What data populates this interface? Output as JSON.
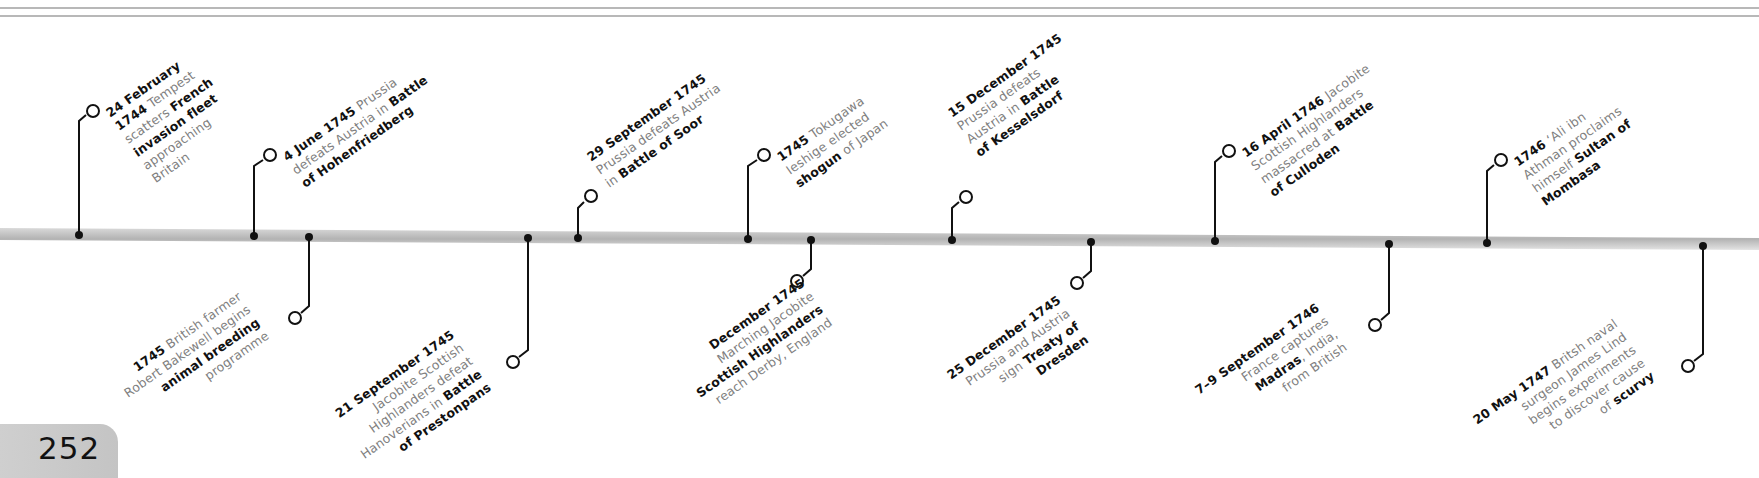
{
  "page": {
    "number": "252"
  },
  "timeline": {
    "bar_color": "#bdbdbd",
    "line_color": "#111111",
    "top_events": [
      {
        "lines": [
          [
            {
              "t": "24 February",
              "b": true
            }
          ],
          [
            {
              "t": "1744",
              "b": true
            },
            {
              "t": " Tempest",
              "b": false
            }
          ],
          [
            {
              "t": "scatters ",
              "b": false
            },
            {
              "t": "French",
              "b": true
            }
          ],
          [
            {
              "t": "invasion fleet",
              "b": true
            }
          ],
          [
            {
              "t": "approaching",
              "b": false
            }
          ],
          [
            {
              "t": "Britain",
              "b": false
            }
          ]
        ]
      },
      {
        "lines": [
          [
            {
              "t": "4 June 1745",
              "b": true
            },
            {
              "t": " Prussia",
              "b": false
            }
          ],
          [
            {
              "t": "defeats Austria in ",
              "b": false
            },
            {
              "t": "Battle",
              "b": true
            }
          ],
          [
            {
              "t": "of Hohenfriedberg",
              "b": true
            }
          ]
        ]
      },
      {
        "lines": [
          [
            {
              "t": "29 September 1745",
              "b": true
            }
          ],
          [
            {
              "t": "Prussia defeats Austria",
              "b": false
            }
          ],
          [
            {
              "t": "in ",
              "b": false
            },
            {
              "t": "Battle of Soor",
              "b": true
            }
          ]
        ]
      },
      {
        "lines": [
          [
            {
              "t": "1745",
              "b": true
            },
            {
              "t": " Tokugawa",
              "b": false
            }
          ],
          [
            {
              "t": "Ieshige elected",
              "b": false
            }
          ],
          [
            {
              "t": "shogun",
              "b": true
            },
            {
              "t": " of Japan",
              "b": false
            }
          ]
        ]
      },
      {
        "lines": [
          [
            {
              "t": "15 December 1745",
              "b": true
            }
          ],
          [
            {
              "t": "Prussia defeats",
              "b": false
            }
          ],
          [
            {
              "t": "Austria in ",
              "b": false
            },
            {
              "t": "Battle",
              "b": true
            }
          ],
          [
            {
              "t": "of Kesselsdorf",
              "b": true
            }
          ]
        ]
      },
      {
        "lines": [
          [
            {
              "t": "16 April 1746",
              "b": true
            },
            {
              "t": " Jacobite",
              "b": false
            }
          ],
          [
            {
              "t": "Scottish Highlanders",
              "b": false
            }
          ],
          [
            {
              "t": "massacred at ",
              "b": false
            },
            {
              "t": "Battle",
              "b": true
            }
          ],
          [
            {
              "t": "of Culloden",
              "b": true
            }
          ]
        ]
      },
      {
        "lines": [
          [
            {
              "t": "1746",
              "b": true
            },
            {
              "t": " ‘Ali ibn",
              "b": false
            }
          ],
          [
            {
              "t": "Athman proclaims",
              "b": false
            }
          ],
          [
            {
              "t": "himself ",
              "b": false
            },
            {
              "t": "Sultan of",
              "b": true
            }
          ],
          [
            {
              "t": "Mombasa",
              "b": true
            }
          ]
        ]
      }
    ],
    "bottom_events": [
      {
        "lines": [
          [
            {
              "t": "1745",
              "b": true
            },
            {
              "t": " British farmer",
              "b": false
            }
          ],
          [
            {
              "t": "Robert Bakewell begins",
              "b": false
            }
          ],
          [
            {
              "t": "animal breeding",
              "b": true
            }
          ],
          [
            {
              "t": "programme",
              "b": false
            }
          ]
        ]
      },
      {
        "lines": [
          [
            {
              "t": "21 September 1745",
              "b": true
            }
          ],
          [
            {
              "t": "Jacobite Scottish",
              "b": false
            }
          ],
          [
            {
              "t": "Highlanders defeat",
              "b": false
            }
          ],
          [
            {
              "t": "Hanoverians in ",
              "b": false
            },
            {
              "t": "Battle",
              "b": true
            }
          ],
          [
            {
              "t": "of Prestonpans",
              "b": true
            }
          ]
        ]
      },
      {
        "lines": [
          [
            {
              "t": "December 1745",
              "b": true
            }
          ],
          [
            {
              "t": "Marching Jacobite",
              "b": false
            }
          ],
          [
            {
              "t": "Scottish Highlanders",
              "b": true
            }
          ],
          [
            {
              "t": "reach Derby, England",
              "b": false
            }
          ]
        ]
      },
      {
        "lines": [
          [
            {
              "t": "25 December 1745",
              "b": true
            }
          ],
          [
            {
              "t": "Prussia and Austria",
              "b": false
            }
          ],
          [
            {
              "t": "sign ",
              "b": false
            },
            {
              "t": "Treaty of",
              "b": true
            }
          ],
          [
            {
              "t": "Dresden",
              "b": true
            }
          ]
        ]
      },
      {
        "lines": [
          [
            {
              "t": "7–9 September 1746",
              "b": true
            }
          ],
          [
            {
              "t": "France captures",
              "b": false
            }
          ],
          [
            {
              "t": "Madras",
              "b": true
            },
            {
              "t": ", India,",
              "b": false
            }
          ],
          [
            {
              "t": "from British",
              "b": false
            }
          ]
        ]
      },
      {
        "lines": [
          [
            {
              "t": "20 May 1747",
              "b": true
            },
            {
              "t": " Britsh naval",
              "b": false
            }
          ],
          [
            {
              "t": "surgeon James Lind",
              "b": false
            }
          ],
          [
            {
              "t": "begins experiments",
              "b": false
            }
          ],
          [
            {
              "t": "to discover cause",
              "b": false
            }
          ],
          [
            {
              "t": "of ",
              "b": false
            },
            {
              "t": "scurvy",
              "b": true
            }
          ]
        ]
      }
    ]
  }
}
